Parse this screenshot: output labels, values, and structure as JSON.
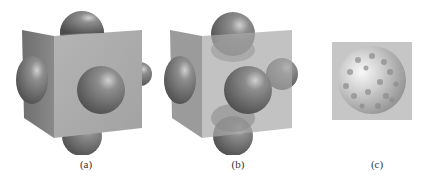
{
  "figure": {
    "panels": [
      {
        "id": "a",
        "caption": "(a)",
        "description": "Opaque cube with spheres protruding from each face"
      },
      {
        "id": "b",
        "caption": "(b)",
        "description": "Semi-transparent cube with spheres protruding from each face"
      },
      {
        "id": "c",
        "caption": "(c)",
        "description": "Sphere with dimpled/spotted texture on square background"
      }
    ],
    "colors": {
      "cube_front": "#a9a9a9",
      "cube_side": "#7a7a7a",
      "sphere_dark": "#555555",
      "sphere_mid": "#8a8a8a",
      "sphere_light": "#d8d8d8",
      "panel_c_bg": "#c8c8c8",
      "background": "#ffffff"
    }
  }
}
